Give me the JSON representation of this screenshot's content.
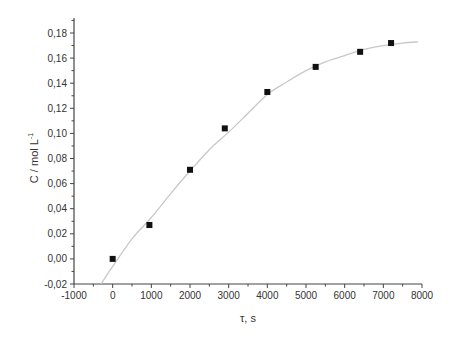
{
  "chart_data": {
    "type": "scatter",
    "title": "",
    "xlabel": "τ, s",
    "ylabel": "C / mol L",
    "ylabel_superscript": "-1",
    "xlim": [
      -1000,
      8000
    ],
    "ylim": [
      -0.02,
      0.18
    ],
    "x_ticks": [
      -1000,
      0,
      1000,
      2000,
      3000,
      4000,
      5000,
      6000,
      7000,
      8000
    ],
    "x_tick_labels": [
      "-1000",
      "0",
      "1000",
      "2000",
      "3000",
      "4000",
      "5000",
      "6000",
      "7000",
      "8000"
    ],
    "y_ticks": [
      -0.02,
      0.0,
      0.02,
      0.04,
      0.06,
      0.08,
      0.1,
      0.12,
      0.14,
      0.16,
      0.18
    ],
    "y_tick_labels": [
      "-0,02",
      "0,00",
      "0,02",
      "0,04",
      "0,06",
      "0,08",
      "0,10",
      "0,12",
      "0,14",
      "0,16",
      "0,18"
    ],
    "grid": false,
    "legend": null,
    "series": [
      {
        "name": "measured",
        "kind": "scatter",
        "marker": "square",
        "color": "#111111",
        "x": [
          0,
          950,
          2000,
          2900,
          4000,
          5250,
          6400,
          7200
        ],
        "y": [
          0.0,
          0.027,
          0.071,
          0.104,
          0.133,
          0.153,
          0.165,
          0.172
        ]
      },
      {
        "name": "fit",
        "kind": "line",
        "color": "#c8c8c8",
        "x": [
          -300,
          0,
          500,
          1000,
          1500,
          2000,
          2500,
          3000,
          3500,
          4000,
          4500,
          5000,
          5500,
          6000,
          6500,
          7000,
          7500,
          7900
        ],
        "y": [
          -0.02,
          -0.006,
          0.016,
          0.033,
          0.052,
          0.07,
          0.087,
          0.101,
          0.116,
          0.131,
          0.141,
          0.15,
          0.157,
          0.162,
          0.167,
          0.17,
          0.172,
          0.173
        ]
      }
    ]
  }
}
